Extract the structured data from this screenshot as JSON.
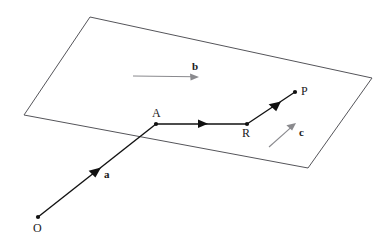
{
  "figure": {
    "type": "vector-geometry-diagram",
    "background_color": "#ffffff",
    "plane": {
      "name": "parallelogram-plane",
      "stroke_color": "#55555a",
      "stroke_width": 1,
      "fill": "none",
      "vertices": [
        {
          "x": 90,
          "y": 17
        },
        {
          "x": 372,
          "y": 78
        },
        {
          "x": 308,
          "y": 168
        },
        {
          "x": 24,
          "y": 115
        }
      ]
    },
    "points": [
      {
        "id": "O",
        "label": "O",
        "x": 38,
        "y": 217,
        "label_x": 33,
        "label_y": 232,
        "dot_radius": 2.1,
        "color": "#111111"
      },
      {
        "id": "A",
        "label": "A",
        "x": 156,
        "y": 124,
        "label_x": 152,
        "label_y": 117,
        "dot_radius": 2.1,
        "color": "#111111"
      },
      {
        "id": "R",
        "label": "R",
        "x": 247,
        "y": 124,
        "label_x": 242,
        "label_y": 137,
        "dot_radius": 2.1,
        "color": "#111111"
      },
      {
        "id": "P",
        "label": "P",
        "x": 295,
        "y": 92,
        "label_x": 301,
        "label_y": 95,
        "dot_radius": 2.1,
        "color": "#111111"
      }
    ],
    "path_segments": [
      {
        "id": "O-to-A",
        "from": "O",
        "to": "A",
        "x1": 38,
        "y1": 217,
        "x2": 156,
        "y2": 124,
        "stroke_color": "#111111",
        "stroke_width": 1.4,
        "mid_arrow_at": 0.52
      },
      {
        "id": "A-to-R",
        "from": "A",
        "to": "R",
        "x1": 156,
        "y1": 124,
        "x2": 247,
        "y2": 124,
        "stroke_color": "#111111",
        "stroke_width": 1.4,
        "mid_arrow_at": 0.52
      },
      {
        "id": "R-to-P",
        "from": "R",
        "to": "P",
        "x1": 247,
        "y1": 124,
        "x2": 295,
        "y2": 92,
        "stroke_color": "#111111",
        "stroke_width": 1.4,
        "mid_arrow_at": 0.55
      }
    ],
    "vectors": [
      {
        "id": "vector-a",
        "label": "a",
        "label_x": 104,
        "label_y": 178,
        "on_segment": "O-to-A",
        "arrow_color": "#111111",
        "description": "arrowhead on segment O to A"
      },
      {
        "id": "vector-b",
        "label": "b",
        "label_x": 192,
        "label_y": 70,
        "x1": 133,
        "y1": 76,
        "x2": 199,
        "y2": 77,
        "stroke_color": "#8a8a8e",
        "stroke_width": 1.1,
        "arrow_color": "#8a8a8e",
        "description": "free vector arrow in plane pointing right"
      },
      {
        "id": "vector-c",
        "label": "c",
        "label_x": 299,
        "label_y": 136,
        "x1": 269,
        "y1": 147,
        "x2": 296,
        "y2": 123,
        "stroke_color": "#8a8a8e",
        "stroke_width": 1.1,
        "arrow_color": "#8a8a8e",
        "description": "free vector arrow in plane pointing up-right"
      }
    ]
  }
}
